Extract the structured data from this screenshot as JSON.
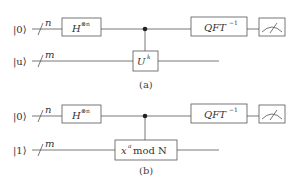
{
  "diagram": {
    "type": "quantum-circuit",
    "subfigures": [
      {
        "caption": "(a)",
        "wires": [
          {
            "input": "|0⟩",
            "register_size": "n"
          },
          {
            "input": "|u⟩",
            "register_size": "m"
          }
        ],
        "gates": [
          {
            "label": "H",
            "superscript": "⊗n",
            "wire": 0
          },
          {
            "label": "U",
            "superscript": "k",
            "wire": 1,
            "controlled_by": 0
          },
          {
            "label": "QFT",
            "superscript": "−1",
            "wire": 0
          },
          {
            "label": "measure",
            "wire": 0
          }
        ]
      },
      {
        "caption": "(b)",
        "wires": [
          {
            "input": "|0⟩",
            "register_size": "n"
          },
          {
            "input": "|1⟩",
            "register_size": "m"
          }
        ],
        "gates": [
          {
            "label": "H",
            "superscript": "⊗n",
            "wire": 0
          },
          {
            "label": "x",
            "superscript": "a",
            "suffix": " mod N",
            "wire": 1,
            "controlled_by": 0
          },
          {
            "label": "QFT",
            "superscript": "−1",
            "wire": 0
          },
          {
            "label": "measure",
            "wire": 0
          }
        ]
      }
    ]
  },
  "labels": {
    "a_in0": "|0⟩",
    "a_in1": "|u⟩",
    "a_n": "n",
    "a_m": "m",
    "a_h": "H",
    "a_h_sup": "⊗n",
    "a_u": "U",
    "a_u_sup": "k",
    "a_qft": "QFT",
    "a_qft_sup": "−1",
    "a_cap": "(a)",
    "b_in0": "|0⟩",
    "b_in1": "|1⟩",
    "b_n": "n",
    "b_m": "m",
    "b_h": "H",
    "b_h_sup": "⊗n",
    "b_x": "x",
    "b_x_sup": "a",
    "b_mod": " mod N",
    "b_qft": "QFT",
    "b_qft_sup": "−1",
    "b_cap": "(b)"
  }
}
